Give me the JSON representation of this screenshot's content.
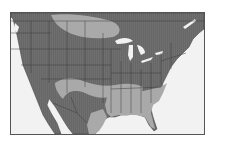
{
  "map": {
    "region": "United States with southern Canada and northern Mexico",
    "style": "grayscale choropleth",
    "colors": {
      "land_base": "#6f6f6f",
      "shaded_zone": "#a9a9a9",
      "water": "#f2f2f2",
      "border": "#3c3c3c",
      "frame": "#555555"
    },
    "zones": [
      {
        "name": "northern-plains-band",
        "shade": "light"
      },
      {
        "name": "southwest-band",
        "shade": "light"
      },
      {
        "name": "southeast-gulf-zone",
        "shade": "light"
      }
    ],
    "water_features": [
      "pacific-ocean",
      "gulf-of-mexico",
      "atlantic-ocean",
      "great-lakes",
      "gulf-of-california"
    ]
  }
}
